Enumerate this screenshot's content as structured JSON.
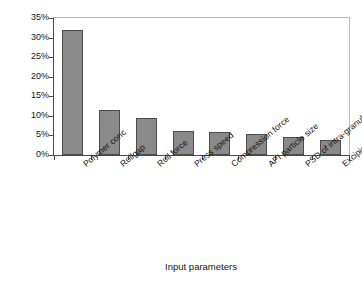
{
  "chart_data": {
    "type": "bar",
    "title": "",
    "subtitle": "",
    "xlabel": "Input parameters",
    "ylabel": "Relative importance",
    "categories": [
      "Polymer conc",
      "Rollgap",
      "Roll force",
      "Press speed",
      "Compression force",
      "API particle size",
      "PSD of intra-granular blend",
      "Excipient particle size"
    ],
    "values": [
      32.0,
      11.5,
      9.5,
      6.1,
      5.8,
      5.3,
      4.5,
      3.8
    ],
    "value_labels": [
      "32%",
      "11.5%",
      "9.5%",
      "6.1%",
      "5.8%",
      "5.3%",
      "4.5%",
      "3.8%"
    ],
    "ylim": [
      0,
      35
    ],
    "ytick_values": [
      0,
      5,
      10,
      15,
      20,
      25,
      30,
      35
    ],
    "ytick_labels": [
      "0%",
      "5%",
      "10%",
      "15%",
      "20%",
      "25%",
      "30%",
      "35%"
    ],
    "grid": false,
    "legend": null,
    "legend_position": "none",
    "bar_color": "#8a8a8a",
    "bar_edge_color": "#4c4c4c",
    "axis_color": "#4a4a4a",
    "frame_color": "#b9b9b9",
    "background": "#ffffff",
    "xtick_label_rotation": -40
  }
}
